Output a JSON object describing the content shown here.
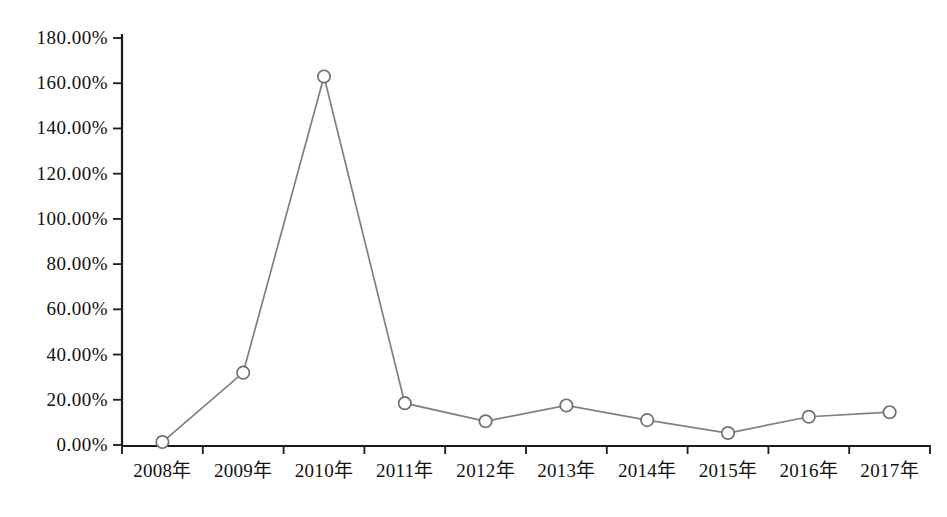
{
  "chart_data": {
    "type": "line",
    "title": "",
    "subtitle": "",
    "xlabel": "",
    "ylabel": "",
    "categories": [
      "2008年",
      "2009年",
      "2010年",
      "2011年",
      "2012年",
      "2013年",
      "2014年",
      "2015年",
      "2016年",
      "2017年"
    ],
    "values": [
      1.3,
      32.0,
      163.0,
      18.5,
      10.5,
      17.5,
      11.0,
      5.3,
      12.5,
      14.5
    ],
    "series": [
      {
        "name": "",
        "values": [
          1.3,
          32.0,
          163.0,
          18.5,
          10.5,
          17.5,
          11.0,
          5.3,
          12.5,
          14.5
        ]
      }
    ],
    "ylim": [
      0,
      180
    ],
    "ytick_values": [
      0,
      20,
      40,
      60,
      80,
      100,
      120,
      140,
      160,
      180
    ],
    "ytick_labels": [
      "0.00%",
      "20.00%",
      "40.00%",
      "60.00%",
      "80.00%",
      "100.00%",
      "120.00%",
      "140.00%",
      "160.00%",
      "180.00%"
    ],
    "grid": false,
    "legend": "none",
    "line_color": "#808080",
    "marker_fill": "#ffffff",
    "marker_stroke": "#707070",
    "axis_color": "#1a1a1a",
    "background_color": "#ffffff"
  },
  "axes": {
    "y_axis_name": "y-axis",
    "x_axis_name": "x-axis"
  }
}
